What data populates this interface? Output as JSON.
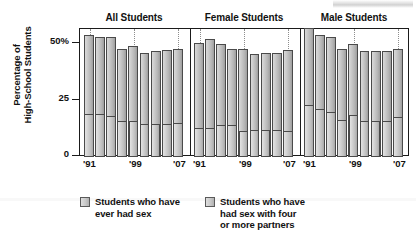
{
  "chart_data": {
    "type": "bar",
    "title": "",
    "subtitle": "",
    "xlabel": "",
    "ylabel": "Percentage of High-School Students",
    "ylabel_lines": [
      "Percentage of",
      "High-School Students"
    ],
    "ylim": [
      0,
      57
    ],
    "yticks": [
      0,
      25,
      50
    ],
    "ytick_labels": [
      "0",
      "25",
      "50%"
    ],
    "grid": false,
    "legend_position": "bottom",
    "stacked": true,
    "panels": [
      {
        "name": "All Students",
        "categories": [
          "'91",
          "'93",
          "'95",
          "'97",
          "'99",
          "'01",
          "'03",
          "'05",
          "'07"
        ],
        "xtick_labels": [
          "'91",
          "'99",
          "'07"
        ],
        "xtick_positions": [
          0,
          4,
          8
        ],
        "series": [
          {
            "name": "Students who have ever had sex",
            "values": [
              54,
              53,
              53,
              48,
              49,
              46,
              47,
              47.5,
              48
            ]
          },
          {
            "name": "Students who have had sex with four or more partners",
            "values": [
              19,
              19,
              18,
              16,
              16,
              14.5,
              14.5,
              14.5,
              15
            ]
          }
        ]
      },
      {
        "name": "Female Students",
        "categories": [
          "'91",
          "'93",
          "'95",
          "'97",
          "'99",
          "'01",
          "'03",
          "'05",
          "'07"
        ],
        "xtick_labels": [
          "'91",
          "'99",
          "'07"
        ],
        "xtick_positions": [
          0,
          4,
          8
        ],
        "series": [
          {
            "name": "Students who have ever had sex",
            "values": [
              50.5,
              52,
              50,
              48,
              48,
              45.5,
              46,
              46,
              47.5
            ]
          },
          {
            "name": "Students who have had sex with four or more partners",
            "values": [
              13,
              13,
              14,
              14,
              11.5,
              12,
              12,
              12,
              11.5
            ]
          }
        ]
      },
      {
        "name": "Male Students",
        "categories": [
          "'91",
          "'93",
          "'95",
          "'97",
          "'99",
          "'01",
          "'03",
          "'05",
          "'07"
        ],
        "xtick_labels": [
          "'91",
          "'99",
          "'07"
        ],
        "xtick_positions": [
          0,
          4,
          8
        ],
        "series": [
          {
            "name": "Students who have ever had sex",
            "values": [
              57,
              54,
              53,
              48,
              50,
              47,
              47,
              47,
              48
            ]
          },
          {
            "name": "Students who have had sex with four or more partners",
            "values": [
              23,
              21,
              20,
              16.5,
              18.5,
              16,
              16,
              16,
              17.5
            ]
          }
        ]
      }
    ],
    "legend": [
      {
        "label_lines": [
          "Students who have",
          "ever had sex"
        ],
        "label": "Students who have ever had sex",
        "color": "#cfcfcf"
      },
      {
        "label_lines": [
          "Students who have",
          "had sex with four",
          "or more partners"
        ],
        "label": "Students who have had sex with four or more partners",
        "color": "#cfcfcf"
      }
    ]
  }
}
